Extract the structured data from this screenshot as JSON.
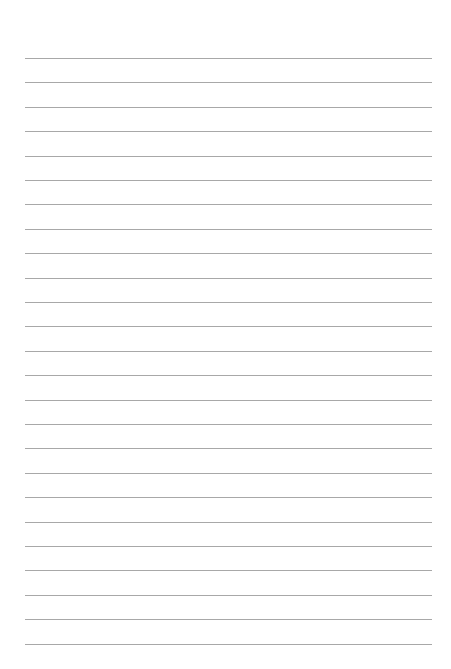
{
  "page": {
    "type": "lined-paper",
    "line_count": 25,
    "first_line_y": 58,
    "line_spacing": 24.4,
    "line_left": 25,
    "line_width": 407,
    "line_color": "#a8a8a8",
    "background_color": "#ffffff"
  }
}
